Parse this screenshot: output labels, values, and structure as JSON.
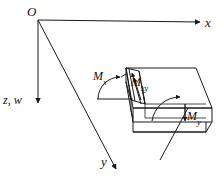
{
  "figure": {
    "type": "engineering-diagram",
    "background_color": "#ffffff",
    "line_color": "#1a1a1a",
    "axes": {
      "origin_label": "O",
      "x_label": "x",
      "z_label": "z, w",
      "y_label": "y"
    },
    "moments": {
      "mx": {
        "base": "M",
        "sub": "x"
      },
      "mxy": {
        "base": "M",
        "sub": "xy"
      },
      "my": {
        "base": "M",
        "sub": "y"
      }
    }
  }
}
